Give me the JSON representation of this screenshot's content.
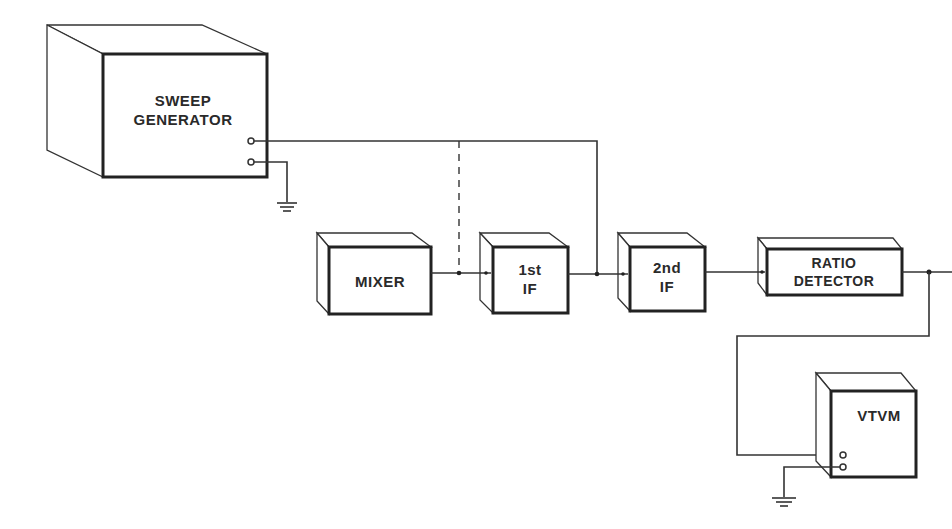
{
  "diagram": {
    "colors": {
      "ink": "#222222",
      "background": "#ffffff"
    },
    "blocks": [
      {
        "id": "sweep_generator",
        "lines": [
          "SWEEP",
          "GENERATOR"
        ]
      },
      {
        "id": "mixer",
        "lines": [
          "MIXER"
        ]
      },
      {
        "id": "first_if",
        "lines": [
          "1st",
          "IF"
        ]
      },
      {
        "id": "second_if",
        "lines": [
          "2nd",
          "IF"
        ]
      },
      {
        "id": "ratio_detector",
        "lines": [
          "RATIO",
          "DETECTOR"
        ]
      },
      {
        "id": "vtvm",
        "lines": [
          "VTVM"
        ]
      }
    ],
    "connections": [
      {
        "from": "mixer",
        "to": "first_if",
        "style": "solid"
      },
      {
        "from": "first_if",
        "to": "second_if",
        "style": "solid"
      },
      {
        "from": "second_if",
        "to": "ratio_detector",
        "style": "solid"
      },
      {
        "from": "ratio_detector",
        "to": "output",
        "style": "solid"
      },
      {
        "from": "sweep_generator",
        "to": "first_if_output",
        "style": "solid"
      },
      {
        "from": "sweep_generator",
        "to": "mixer_output",
        "style": "dashed"
      },
      {
        "from": "ratio_detector_output",
        "to": "vtvm",
        "style": "solid"
      },
      {
        "from": "sweep_generator",
        "to": "ground",
        "style": "solid"
      },
      {
        "from": "vtvm",
        "to": "ground",
        "style": "solid"
      }
    ]
  }
}
